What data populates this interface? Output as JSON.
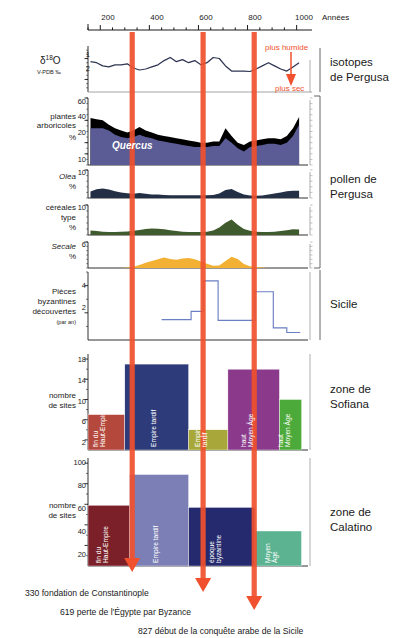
{
  "figure": {
    "x_axis": {
      "label": "Années",
      "ticks": [
        200,
        400,
        600,
        800,
        1000
      ],
      "minor_step": 50,
      "range": [
        150,
        1030
      ]
    },
    "event_markers": [
      {
        "year": 330,
        "color": "#f0502d",
        "caption": "330 fondation de Constantinople"
      },
      {
        "year": 619,
        "color": "#f0502d",
        "caption": "619 perte de l'Égypte par Byzance"
      },
      {
        "year": 827,
        "color": "#f0502d",
        "caption": "827 début de la conquête arabe de la Sicile"
      }
    ],
    "group_labels": {
      "isotopes": "isotopes\nde Pergusa",
      "isotopes_l1": "isotopes",
      "isotopes_l2": "de Pergusa",
      "pollen_l1": "pollen de",
      "pollen_l2": "Pergusa",
      "sicile": "Sicile",
      "sofiana_l1": "zone de",
      "sofiana_l2": "Sofiana",
      "calatino_l1": "zone de",
      "calatino_l2": "Calatino"
    },
    "annotations": {
      "plus_humide": "plus humide",
      "plus_sec": "plus sec"
    }
  },
  "chart_data": [
    {
      "type": "line",
      "title": "isotopes de Pergusa",
      "ylabel": "δ18O",
      "ylabel_sub": "V-PDB ‰",
      "ylabel_main": "O",
      "ylabel_delta": "δ",
      "ylabel_exp": "18",
      "yticks": [
        1,
        2
      ],
      "ylim": [
        2.6,
        0.4
      ],
      "y_inverted": true,
      "xlabel": "Années",
      "grid": false,
      "annotation_top": "plus humide",
      "annotation_bottom": "plus sec",
      "line_color": "#2e3552",
      "x": [
        160,
        185,
        210,
        235,
        260,
        285,
        310,
        335,
        360,
        385,
        410,
        435,
        460,
        485,
        510,
        535,
        560,
        585,
        610,
        635,
        660,
        685,
        710,
        735,
        760,
        785,
        810,
        835,
        860,
        885,
        910,
        935,
        960,
        985,
        1010
      ],
      "values": [
        1.15,
        1.2,
        1.35,
        1.4,
        1.3,
        1.3,
        1.25,
        1.45,
        1.55,
        1.5,
        1.4,
        1.3,
        1.1,
        0.95,
        1.15,
        1.05,
        1.2,
        1.1,
        1.3,
        1.2,
        0.95,
        1.0,
        1.35,
        1.6,
        1.6,
        1.6,
        1.62,
        1.5,
        1.35,
        1.2,
        1.35,
        1.5,
        1.6,
        1.4,
        1.2
      ]
    },
    {
      "type": "area",
      "title": "plantes arboricoles",
      "ylabel_l1": "plantes",
      "ylabel_l2": "arboricoles",
      "ylabel_l3": "%",
      "yticks": [
        10,
        20,
        40,
        60
      ],
      "ylim": [
        0,
        60
      ],
      "series": [
        {
          "name": "plantes arboricoles",
          "color": "#000000",
          "values": [
            42,
            41,
            40,
            36,
            33,
            31,
            29,
            31,
            34,
            31,
            29,
            27,
            26,
            25,
            24,
            23,
            22,
            21,
            20,
            20,
            21,
            21,
            33,
            26,
            20,
            18,
            21,
            22,
            23,
            24,
            24,
            23,
            26,
            33,
            43
          ]
        },
        {
          "name": "Quercus",
          "color": "#5b5b96",
          "values": [
            33,
            33,
            33,
            31,
            27,
            25,
            24,
            25,
            27,
            25,
            24,
            22,
            21,
            20,
            19,
            18,
            17,
            16,
            16,
            16,
            17,
            17,
            24,
            20,
            15,
            12,
            16,
            17,
            18,
            19,
            19,
            18,
            20,
            26,
            36
          ]
        }
      ],
      "x": [
        160,
        185,
        210,
        235,
        260,
        285,
        310,
        335,
        360,
        385,
        410,
        435,
        460,
        485,
        510,
        535,
        560,
        585,
        610,
        635,
        660,
        685,
        710,
        735,
        760,
        785,
        810,
        835,
        860,
        885,
        910,
        935,
        960,
        985,
        1010
      ],
      "inner_label": "Quercus"
    },
    {
      "type": "area",
      "title": "Olea",
      "ylabel_l1": "Olea",
      "ylabel_l2": "%",
      "yticks": [
        10
      ],
      "ylim": [
        0,
        10
      ],
      "color": "#232f44",
      "x": [
        160,
        185,
        210,
        235,
        260,
        285,
        310,
        335,
        360,
        385,
        410,
        435,
        460,
        485,
        510,
        535,
        560,
        585,
        610,
        635,
        660,
        685,
        710,
        735,
        760,
        785,
        810,
        835,
        860,
        885,
        910,
        935,
        960,
        985,
        1010
      ],
      "values": [
        2.3,
        3.1,
        3.4,
        3.0,
        2.4,
        2.0,
        1.7,
        1.5,
        1.8,
        1.5,
        1.3,
        1.2,
        1.1,
        1.0,
        1.0,
        1.0,
        1.0,
        1.0,
        1.0,
        1.0,
        1.1,
        1.6,
        2.9,
        3.2,
        2.1,
        1.2,
        0.9,
        0.8,
        0.9,
        1.2,
        1.6,
        2.0,
        2.4,
        2.6,
        2.6
      ]
    },
    {
      "type": "area",
      "title": "céréales type",
      "ylabel_l1": "céréales",
      "ylabel_l2": "type",
      "ylabel_l3": "%",
      "yticks": [
        10
      ],
      "ylim": [
        0,
        10
      ],
      "color": "#3f5a2c",
      "x": [
        160,
        185,
        210,
        235,
        260,
        285,
        310,
        335,
        360,
        385,
        410,
        435,
        460,
        485,
        510,
        535,
        560,
        585,
        610,
        635,
        660,
        685,
        710,
        735,
        760,
        785,
        810,
        835,
        860,
        885,
        910,
        935,
        960,
        985,
        1010
      ],
      "values": [
        1.5,
        1.3,
        1.1,
        1.0,
        1.0,
        1.1,
        1.2,
        1.4,
        1.7,
        2.0,
        2.2,
        2.1,
        1.9,
        1.6,
        1.3,
        1.1,
        1.0,
        1.0,
        1.0,
        1.1,
        1.5,
        2.5,
        4.1,
        5.2,
        3.4,
        2.0,
        1.4,
        1.1,
        1.0,
        1.0,
        1.1,
        1.3,
        1.6,
        1.9,
        1.8
      ]
    },
    {
      "type": "area",
      "title": "Secale",
      "ylabel_l1": "Secale",
      "ylabel_l2": "%",
      "yticks": [
        6
      ],
      "ylim": [
        0,
        6
      ],
      "color": "#f2b134",
      "x": [
        160,
        185,
        210,
        235,
        260,
        285,
        310,
        335,
        360,
        385,
        410,
        435,
        460,
        485,
        510,
        535,
        560,
        585,
        610,
        635,
        660,
        685,
        710,
        735,
        760,
        785,
        810,
        835,
        860,
        885,
        910,
        935,
        960,
        985,
        1010
      ],
      "values": [
        0,
        0,
        0,
        0,
        0,
        0,
        0.1,
        0.3,
        0.7,
        1.2,
        1.6,
        2.0,
        2.4,
        2.1,
        1.9,
        2.2,
        2.3,
        2.0,
        1.5,
        1.0,
        0.5,
        0.6,
        1.6,
        2.6,
        2.1,
        0.9,
        0.4,
        0.2,
        0.1,
        0,
        0,
        0,
        0,
        0,
        0
      ]
    },
    {
      "type": "line",
      "title": "Pièces byzantines découvertes (par an)",
      "ylabel_l1": "Pièces",
      "ylabel_l2": "byzantines",
      "ylabel_l3": "découvertes",
      "ylabel_l4": "(par an)",
      "yticks": [
        2,
        4
      ],
      "ylim": [
        0,
        5
      ],
      "step": true,
      "color": "#6b7fc4",
      "steps": [
        {
          "x0": 450,
          "x1": 570,
          "y": 1.5
        },
        {
          "x0": 570,
          "x1": 620,
          "y": 2.1
        },
        {
          "x0": 620,
          "x1": 680,
          "y": 4.35
        },
        {
          "x0": 680,
          "x1": 830,
          "y": 1.45
        },
        {
          "x0": 830,
          "x1": 905,
          "y": 3.55
        },
        {
          "x0": 905,
          "x1": 960,
          "y": 0.9
        },
        {
          "x0": 960,
          "x1": 1015,
          "y": 0.55
        }
      ]
    },
    {
      "type": "bar",
      "title": "zone de Sofiana",
      "ylabel_l1": "nombre",
      "ylabel_l2": "de sites",
      "yticks": [
        2,
        6,
        10,
        14,
        18
      ],
      "ylim": [
        0,
        19
      ],
      "categories": [
        "fin du Haut-Empire",
        "Empire tardif",
        "Empire tardif",
        "haut Moyen Âge",
        "haut Moyen Âge"
      ],
      "values": [
        7,
        17,
        4,
        16,
        10
      ],
      "bars": [
        {
          "label_l1": "fin du",
          "label_l2": "Haut-Empire",
          "value": 7,
          "color": "#b5483c",
          "x0": 150,
          "x1": 300
        },
        {
          "label_l1": "Empire tardif",
          "label_l2": "",
          "value": 17,
          "color": "#2e3b7a",
          "x0": 300,
          "x1": 560
        },
        {
          "label_l1": "Empire",
          "label_l2": "tardif",
          "value": 4,
          "color": "#a8a83a",
          "x0": 560,
          "x1": 720
        },
        {
          "label_l1": "haut",
          "label_l2": "Moyen Âge",
          "value": 16,
          "color": "#8b3a8b",
          "x0": 720,
          "x1": 930
        },
        {
          "label_l1": "haut",
          "label_l2": "Moyen Âge",
          "value": 10,
          "color": "#4caa3a",
          "x0": 930,
          "x1": 1020
        }
      ]
    },
    {
      "type": "bar",
      "title": "zone de Calatino",
      "ylabel_l1": "nombre",
      "ylabel_l2": "de sites",
      "yticks": [
        20,
        40,
        60,
        80,
        100
      ],
      "ylim": [
        0,
        105
      ],
      "categories": [
        "fin du Haut-Empire",
        "Empire tardif",
        "époque byzantine",
        "Moyen Âge"
      ],
      "values": [
        59,
        89,
        57,
        34
      ],
      "bars": [
        {
          "label_l1": "fin du",
          "label_l2": "Haut-Empire",
          "value": 59,
          "color": "#7b1f28",
          "x0": 150,
          "x1": 320
        },
        {
          "label_l1": "Empire tardif",
          "label_l2": "",
          "value": 89,
          "color": "#7b7fb5",
          "x0": 320,
          "x1": 560
        },
        {
          "label_l1": "époque",
          "label_l2": "byzantine",
          "value": 57,
          "color": "#252a6e",
          "x0": 560,
          "x1": 830
        },
        {
          "label_l1": "Moyen",
          "label_l2": "Âge",
          "value": 34,
          "color": "#5bb391",
          "x0": 830,
          "x1": 1020
        }
      ]
    }
  ]
}
